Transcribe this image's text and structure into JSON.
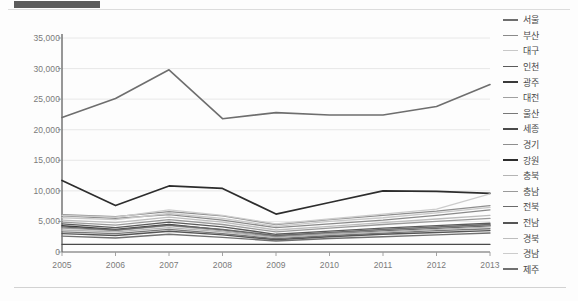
{
  "header": {
    "title_bar_color": "#5b5b5b"
  },
  "chart_data": {
    "type": "line",
    "title": "",
    "xlabel": "",
    "ylabel": "",
    "x": [
      "2005",
      "2006",
      "2007",
      "2008",
      "2009",
      "2010",
      "2011",
      "2012",
      "2013"
    ],
    "ylim": [
      0,
      35000
    ],
    "yticks": [
      "0",
      "5,000",
      "10,000",
      "15,000",
      "20,000",
      "25,000",
      "30,000",
      "35,000"
    ],
    "ytick_values": [
      0,
      5000,
      10000,
      15000,
      20000,
      25000,
      30000,
      35000
    ],
    "grid": true,
    "legend_position": "right",
    "series": [
      {
        "name": "서울",
        "color": "#6e6e6e",
        "width": 1.6,
        "values": [
          22000,
          25100,
          29800,
          21800,
          22800,
          22400,
          22400,
          23800,
          27400
        ]
      },
      {
        "name": "부산",
        "color": "#8a8a8a",
        "width": 1.3,
        "values": [
          5900,
          5500,
          6100,
          5200,
          4000,
          4600,
          5200,
          6000,
          6900
        ]
      },
      {
        "name": "대구",
        "color": "#c8c8c8",
        "width": 1.3,
        "values": [
          5600,
          5300,
          6300,
          5500,
          4200,
          5000,
          5600,
          6400,
          7300
        ]
      },
      {
        "name": "인천",
        "color": "#5a5a5a",
        "width": 1.3,
        "values": [
          4600,
          4000,
          4900,
          4100,
          2900,
          3400,
          3900,
          4300,
          4700
        ]
      },
      {
        "name": "광주",
        "color": "#3a3a3a",
        "width": 1.5,
        "values": [
          4300,
          3700,
          4500,
          3600,
          2500,
          3000,
          3500,
          3900,
          4300
        ]
      },
      {
        "name": "대전",
        "color": "#a0a0a0",
        "width": 1.3,
        "values": [
          3900,
          3500,
          4300,
          3500,
          2600,
          3100,
          3600,
          4000,
          4400
        ]
      },
      {
        "name": "울산",
        "color": "#787878",
        "width": 1.3,
        "values": [
          3300,
          3000,
          3700,
          3000,
          2200,
          2700,
          3100,
          3500,
          3800
        ]
      },
      {
        "name": "세종",
        "color": "#4a4a4a",
        "width": 1.4,
        "values": [
          1250,
          1250,
          1250,
          1250,
          1250,
          1250,
          1250,
          1250,
          1250
        ]
      },
      {
        "name": "경기",
        "color": "#8e8e8e",
        "width": 1.3,
        "values": [
          6100,
          5800,
          6600,
          5900,
          4500,
          5300,
          6000,
          6700,
          7600
        ]
      },
      {
        "name": "강원",
        "color": "#2d2d2d",
        "width": 1.7,
        "values": [
          11700,
          7600,
          10800,
          10400,
          6200,
          8100,
          10000,
          9900,
          9600
        ]
      },
      {
        "name": "충북",
        "color": "#b4b4b4",
        "width": 1.3,
        "values": [
          3600,
          3300,
          4000,
          3300,
          2400,
          2900,
          3300,
          3700,
          4100
        ]
      },
      {
        "name": "충남",
        "color": "#9a9a9a",
        "width": 1.3,
        "values": [
          4900,
          4400,
          5300,
          4500,
          3300,
          3900,
          4500,
          5000,
          5500
        ]
      },
      {
        "name": "전북",
        "color": "#6a6a6a",
        "width": 1.3,
        "values": [
          4100,
          3600,
          4400,
          3700,
          2700,
          3200,
          3700,
          4100,
          4500
        ]
      },
      {
        "name": "전남",
        "color": "#555555",
        "width": 1.4,
        "values": [
          3000,
          2700,
          3400,
          2800,
          2000,
          2500,
          2900,
          3200,
          3500
        ]
      },
      {
        "name": "경북",
        "color": "#bdbdbd",
        "width": 1.3,
        "values": [
          5200,
          4800,
          5700,
          4900,
          3600,
          4200,
          4800,
          5400,
          6000
        ]
      },
      {
        "name": "경남",
        "color": "#cccccc",
        "width": 1.3,
        "values": [
          6000,
          5700,
          6900,
          6000,
          4600,
          5400,
          6200,
          7000,
          9500
        ]
      },
      {
        "name": "제주",
        "color": "#707070",
        "width": 1.4,
        "values": [
          2600,
          2300,
          2900,
          2400,
          1800,
          2200,
          2500,
          2800,
          3100
        ]
      }
    ]
  }
}
